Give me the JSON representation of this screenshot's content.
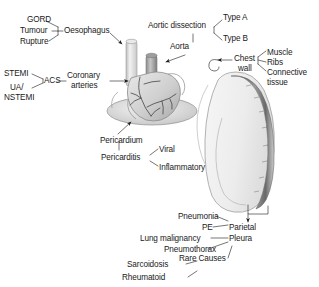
{
  "figure": {
    "type": "annotated-anatomy-diagram",
    "colors": {
      "background": "#ffffff",
      "text": "#1a1a1a",
      "leader_line": "#2b2b2b",
      "heart_fill": "#d8d8d8",
      "heart_shadow": "#9a9a9a",
      "vessel_light": "#e4e4e4",
      "vessel_dark": "#8e8e8e",
      "coronary_line": "#3a3a3a",
      "lung_fill": "#efefef",
      "lung_outline": "#9e9e9e",
      "chest_wall_band": "#6f6f6f",
      "pericardium_fill": "#e8e8e8"
    }
  },
  "labels": {
    "gord": "GORD",
    "tumour": "Tumour",
    "rupture": "Rupture",
    "oesophagus": "Oesophagus",
    "stemi": "STEMI",
    "ua": "UA/",
    "nstemi": "NSTEMI",
    "acs": "ACS",
    "coronary_line1": "Coronary",
    "coronary_line2": "arteries",
    "aortic_dissection": "Aortic dissection",
    "type_a": "Type A",
    "type_b": "Type B",
    "aorta": "Aorta",
    "chest_line1": "Chest",
    "chest_line2": "wall",
    "muscle": "Muscle",
    "ribs": "Ribs",
    "connective_line1": "Connective",
    "connective_line2": "tissue",
    "pericardium": "Pericardium",
    "pericarditis": "Pericarditis",
    "viral": "Viral",
    "inflammatory": "Inflammatory",
    "pneumonia": "Pneumonia",
    "pe": "PE",
    "parietal": "Parietal",
    "lung_malignancy": "Lung malignancy",
    "pleura": "Pleura",
    "pneumothorax": "Pneumothorax",
    "sarcoidosis": "Sarcoidosis",
    "rare_causes": "Rare Causes",
    "rheumatoid": "Rheumatoid"
  },
  "groups": [
    {
      "name": "oesophagus-causes",
      "parent": "Oesophagus",
      "children": [
        "GORD",
        "Tumour",
        "Rupture"
      ]
    },
    {
      "name": "acs-causes",
      "parent": "Coronary arteries",
      "intermediate": "ACS",
      "children": [
        "STEMI",
        "UA/NSTEMI"
      ]
    },
    {
      "name": "aorta-causes",
      "parent": "Aorta",
      "intermediate": "Aortic dissection",
      "children": [
        "Type A",
        "Type B"
      ]
    },
    {
      "name": "chest-wall-causes",
      "parent": "Chest wall",
      "children": [
        "Muscle",
        "Ribs",
        "Connective tissue"
      ]
    },
    {
      "name": "pericardium-causes",
      "parent": "Pericardium",
      "intermediate": "Pericarditis",
      "children": [
        "Viral",
        "Inflammatory"
      ]
    },
    {
      "name": "pleura-causes",
      "parent": "Parietal Pleura",
      "children": [
        "Pneumonia",
        "PE",
        "Lung malignancy",
        "Pneumothorax"
      ]
    },
    {
      "name": "rare-causes",
      "parent": "Rare Causes",
      "children": [
        "Sarcoidosis",
        "Rheumatoid"
      ]
    }
  ]
}
